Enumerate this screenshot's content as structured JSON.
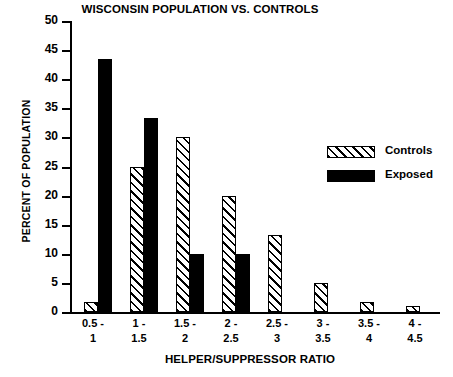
{
  "chart_data": {
    "type": "bar",
    "title": "WISCONSIN POPULATION VS. CONTROLS",
    "xlabel": "HELPER/SUPPRESSOR RATIO",
    "ylabel": "PERCENT OF POPULATION",
    "categories": [
      "0.5 - 1",
      "1 - 1.5",
      "1.5 - 2",
      "2 - 2.5",
      "2.5 - 3",
      "3 - 3.5",
      "3.5 - 4",
      "4 - 4.5"
    ],
    "category_lines": [
      {
        "l1": "0.5 -",
        "l2": "1"
      },
      {
        "l1": "1 -",
        "l2": "1.5"
      },
      {
        "l1": "1.5 -",
        "l2": "2"
      },
      {
        "l1": "2 -",
        "l2": "2.5"
      },
      {
        "l1": "2.5 -",
        "l2": "3"
      },
      {
        "l1": "3 -",
        "l2": "3.5"
      },
      {
        "l1": "3.5 -",
        "l2": "4"
      },
      {
        "l1": "4 -",
        "l2": "4.5"
      }
    ],
    "series": [
      {
        "name": "Controls",
        "fill": "hatched",
        "values": [
          1.7,
          25,
          30,
          20,
          13.3,
          5,
          1.7,
          1
        ]
      },
      {
        "name": "Exposed",
        "fill": "solid",
        "values": [
          43.5,
          33.4,
          10,
          10,
          0,
          0,
          0,
          0
        ]
      }
    ],
    "ylim": [
      0,
      50
    ],
    "yticks": [
      0,
      5,
      10,
      15,
      20,
      25,
      30,
      35,
      40,
      45,
      50
    ],
    "ytick_labels": [
      "0",
      "5",
      "10",
      "15",
      "20",
      "25",
      "30",
      "35",
      "40",
      "45",
      "50"
    ],
    "grid": false,
    "legend_position": "right-center",
    "colors": {
      "controls": "#ffffff",
      "exposed": "#000000",
      "axis": "#000000"
    }
  },
  "legend": {
    "items": [
      {
        "label": "Controls",
        "swatch": "hatched"
      },
      {
        "label": "Exposed",
        "swatch": "solid"
      }
    ]
  }
}
